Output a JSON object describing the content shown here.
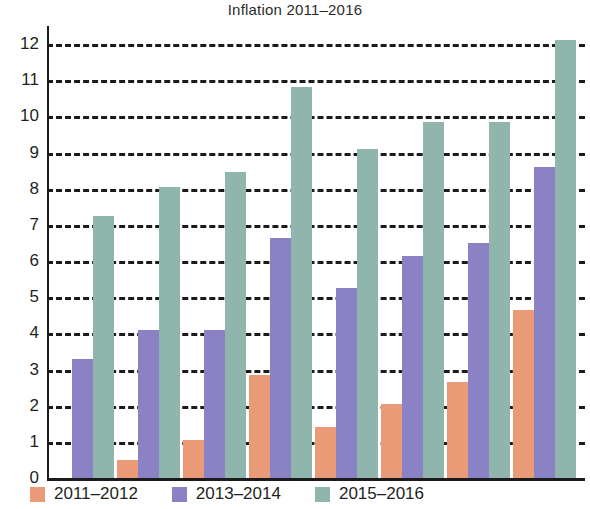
{
  "chart_data": {
    "type": "bar",
    "title": "Inflation 2011–2016",
    "xlabel": "",
    "ylabel": "",
    "ylim": [
      0,
      12.5
    ],
    "yticks": [
      0,
      1,
      2,
      3,
      4,
      5,
      6,
      7,
      8,
      9,
      10,
      11,
      12
    ],
    "ytick_labels": [
      "0",
      "1",
      "2",
      "3",
      "4",
      "5",
      "6",
      "7",
      "8",
      "9",
      "10",
      "11",
      "12"
    ],
    "categories": [
      "",
      "",
      "",
      "",
      "",
      "",
      "",
      ""
    ],
    "grid": true,
    "grid_style": "dashed-horizontal",
    "legend_position": "bottom-left",
    "series": [
      {
        "name": "2011–2012",
        "color": "#eb9a77",
        "values": [
          0,
          0.5,
          1.05,
          2.85,
          1.4,
          2.05,
          2.65,
          4.65
        ]
      },
      {
        "name": "2013–2014",
        "color": "#8b82c6",
        "values": [
          3.3,
          4.1,
          4.1,
          6.65,
          5.25,
          6.15,
          6.5,
          8.6
        ]
      },
      {
        "name": "2015–2016",
        "color": "#8fb5ac",
        "values": [
          7.25,
          8.05,
          8.45,
          10.8,
          9.1,
          9.85,
          9.85,
          12.1
        ]
      }
    ]
  },
  "axis": {
    "zero_label": "0"
  }
}
